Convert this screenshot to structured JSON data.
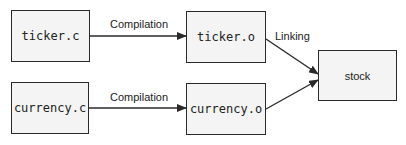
{
  "diagram": {
    "nodes": [
      {
        "id": "ticker_c",
        "label": "ticker.c",
        "style": "monospace"
      },
      {
        "id": "ticker_o",
        "label": "ticker.o",
        "style": "monospace"
      },
      {
        "id": "currency_c",
        "label": "currency.c",
        "style": "monospace"
      },
      {
        "id": "currency_o",
        "label": "currency.o",
        "style": "monospace"
      },
      {
        "id": "stock",
        "label": "stock",
        "style": "sans"
      }
    ],
    "edges": [
      {
        "from": "ticker_c",
        "to": "ticker_o",
        "label": "Compilation"
      },
      {
        "from": "currency_c",
        "to": "currency_o",
        "label": "Compilation"
      },
      {
        "from": "ticker_o",
        "to": "stock",
        "label": "Linking"
      },
      {
        "from": "currency_o",
        "to": "stock",
        "label": ""
      }
    ],
    "colors": {
      "box_fill": "#f4f4f4",
      "stroke": "#2a2a2a",
      "background": "#ffffff"
    }
  }
}
